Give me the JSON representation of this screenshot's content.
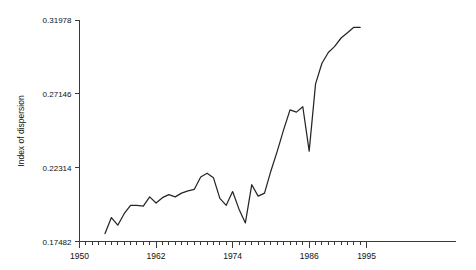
{
  "chart_data": {
    "type": "line",
    "title": "",
    "xlabel": "",
    "ylabel": "Index of dispersion",
    "xlim": [
      1950,
      1995
    ],
    "ylim": [
      0.17482,
      0.31978
    ],
    "grid": false,
    "legend": "none",
    "y_ticks": [
      "0.17482",
      "0.22314",
      "0.27146",
      "0.31978"
    ],
    "y_tick_values": [
      0.17482,
      0.22314,
      0.27146,
      0.31978
    ],
    "x_ticks": [
      "1950",
      "1962",
      "1974",
      "1986",
      "1995"
    ],
    "x_tick_values": [
      1950,
      1962,
      1974,
      1986,
      1995
    ],
    "x_minor_tick_interval": 1,
    "x": [
      1954,
      1955,
      1956,
      1957,
      1958,
      1959,
      1960,
      1961,
      1962,
      1963,
      1964,
      1965,
      1966,
      1967,
      1968,
      1969,
      1970,
      1971,
      1972,
      1973,
      1974,
      1975,
      1976,
      1977,
      1978,
      1979,
      1980,
      1981,
      1982,
      1983,
      1984,
      1985,
      1986,
      1987,
      1988,
      1989,
      1990,
      1991,
      1992,
      1993,
      1994
    ],
    "values": [
      0.18,
      0.1905,
      0.1855,
      0.193,
      0.1985,
      0.1985,
      0.198,
      0.204,
      0.2,
      0.2035,
      0.2055,
      0.204,
      0.2065,
      0.208,
      0.209,
      0.217,
      0.2195,
      0.2165,
      0.203,
      0.1985,
      0.2075,
      0.196,
      0.187,
      0.212,
      0.2045,
      0.2065,
      0.221,
      0.234,
      0.248,
      0.261,
      0.2595,
      0.263,
      0.234,
      0.278,
      0.2915,
      0.2985,
      0.3025,
      0.308,
      0.3115,
      0.315,
      0.315
    ]
  }
}
